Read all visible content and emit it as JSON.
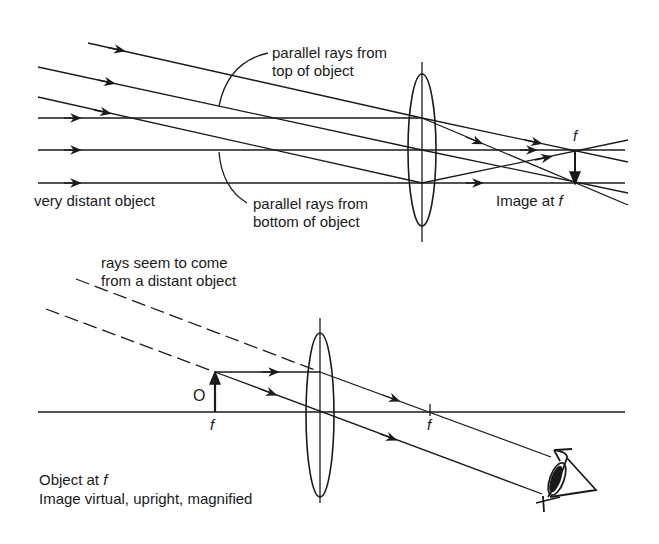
{
  "top_diagram": {
    "title": "Converging lens with very distant object",
    "labels": {
      "top_rays_line1": "parallel rays from",
      "top_rays_line2": "top of object",
      "bottom_rays_line1": "parallel rays from",
      "bottom_rays_line2": "bottom of object",
      "object": "very distant object",
      "image": "Image at ",
      "image_f": "f",
      "focal": "f"
    }
  },
  "bottom_diagram": {
    "title": "Magnifier with object at focal point",
    "labels": {
      "rays_line1": "rays seem to come",
      "rays_line2": "from a distant object",
      "object_marker": "O",
      "focal_left": "f",
      "focal_right": "f",
      "caption_line1": "Object at ",
      "caption_line1_f": "f",
      "caption_line2": "Image virtual, upright, magnified"
    }
  },
  "colors": {
    "ink": "#1a1a1a",
    "background": "#ffffff"
  }
}
